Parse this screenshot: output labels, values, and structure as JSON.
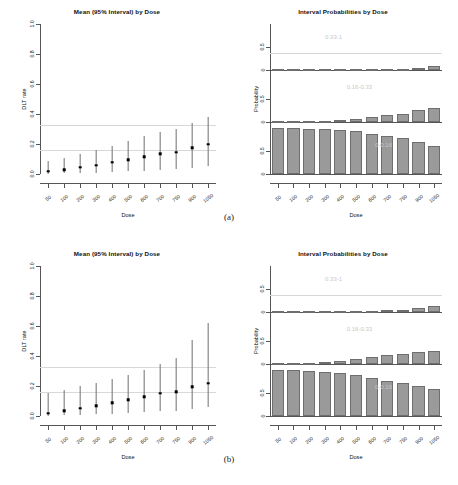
{
  "figure": {
    "subfigures": [
      {
        "caption": "(a)"
      },
      {
        "caption": "(b)"
      }
    ]
  },
  "panels": {
    "mean_title": "Mean (95% Interval) by Dose",
    "interval_title": "Interval Probabilities by Dose",
    "xlabel": "Dose",
    "ylabel_mean": "DLT rate",
    "ylabel_interval": "Probability",
    "y_ticks_mean": [
      "0.0",
      "0.2",
      "0.4",
      "0.6",
      "0.8",
      "1.0"
    ],
    "y_ticks_interval": [
      "0",
      "0.5",
      "0",
      "0.5",
      "0",
      "0.5"
    ],
    "x_ticks": [
      "50",
      "100",
      "200",
      "300",
      "400",
      "500",
      "600",
      "700",
      "750",
      "900",
      "1050"
    ],
    "group_labels": {
      "high": "0.33-1",
      "target": "0.16-0.33",
      "low": "0-0.16"
    },
    "colors": {
      "bar_fill": "#9a9a9a",
      "bar_border": "#6e6e6e",
      "point": "#000000",
      "errorbar": "#6f6f6f",
      "axis": "#555555",
      "group_label": "#c8c8c8",
      "reference_line": "#d8d8d8"
    }
  },
  "chart_data": [
    {
      "type": "scatter",
      "id": "a-mean",
      "title": "Mean (95% Interval) by Dose",
      "xlabel": "Dose",
      "ylabel": "DLT rate",
      "ylim": [
        0.0,
        1.0
      ],
      "grid": false,
      "reference_lines": [
        0.16,
        0.33
      ],
      "categories": [
        "50",
        "100",
        "200",
        "300",
        "400",
        "500",
        "600",
        "700",
        "750",
        "900",
        "1050"
      ],
      "mean": [
        0.026,
        0.038,
        0.052,
        0.068,
        0.087,
        0.104,
        0.124,
        0.145,
        0.154,
        0.183,
        0.207
      ],
      "lower": [
        0.002,
        0.004,
        0.006,
        0.009,
        0.013,
        0.017,
        0.022,
        0.028,
        0.031,
        0.042,
        0.053
      ],
      "upper": [
        0.086,
        0.11,
        0.134,
        0.16,
        0.19,
        0.219,
        0.251,
        0.283,
        0.297,
        0.342,
        0.383
      ]
    },
    {
      "type": "bar",
      "id": "a-interval",
      "title": "Interval Probabilities by Dose",
      "xlabel": "Dose",
      "ylabel": "Probability",
      "grid": false,
      "categories": [
        "50",
        "100",
        "200",
        "300",
        "400",
        "500",
        "600",
        "700",
        "750",
        "900",
        "1050"
      ],
      "series": [
        {
          "name": "0.33-1",
          "values": [
            0.0,
            0.0,
            0.001,
            0.002,
            0.004,
            0.008,
            0.015,
            0.025,
            0.031,
            0.053,
            0.078
          ]
        },
        {
          "name": "0.16-0.33",
          "values": [
            0.002,
            0.005,
            0.011,
            0.022,
            0.04,
            0.067,
            0.108,
            0.157,
            0.182,
            0.254,
            0.313
          ]
        },
        {
          "name": "0-0.16",
          "values": [
            0.998,
            0.995,
            0.988,
            0.976,
            0.956,
            0.925,
            0.877,
            0.818,
            0.787,
            0.693,
            0.609
          ]
        }
      ]
    },
    {
      "type": "scatter",
      "id": "b-mean",
      "title": "Mean (95% Interval) by Dose",
      "xlabel": "Dose",
      "ylabel": "DLT rate",
      "ylim": [
        0.0,
        1.0
      ],
      "grid": false,
      "reference_lines": [
        0.16,
        0.33
      ],
      "categories": [
        "50",
        "100",
        "200",
        "300",
        "400",
        "500",
        "600",
        "700",
        "750",
        "900",
        "1050"
      ],
      "mean": [
        0.028,
        0.042,
        0.06,
        0.078,
        0.098,
        0.117,
        0.137,
        0.16,
        0.17,
        0.202,
        0.228
      ],
      "lower": [
        0.003,
        0.005,
        0.008,
        0.012,
        0.016,
        0.021,
        0.026,
        0.033,
        0.036,
        0.047,
        0.058
      ],
      "upper": [
        0.152,
        0.175,
        0.199,
        0.222,
        0.25,
        0.275,
        0.305,
        0.345,
        0.39,
        0.505,
        0.622
      ]
    },
    {
      "type": "bar",
      "id": "b-interval",
      "title": "Interval Probabilities by Dose",
      "xlabel": "Dose",
      "ylabel": "Probability",
      "grid": false,
      "categories": [
        "50",
        "100",
        "200",
        "300",
        "400",
        "500",
        "600",
        "700",
        "750",
        "900",
        "1050"
      ],
      "series": [
        {
          "name": "0.33-1",
          "values": [
            0.0,
            0.0,
            0.001,
            0.003,
            0.006,
            0.012,
            0.024,
            0.041,
            0.05,
            0.085,
            0.124
          ]
        },
        {
          "name": "0.16-0.33",
          "values": [
            0.003,
            0.008,
            0.019,
            0.036,
            0.063,
            0.099,
            0.152,
            0.202,
            0.223,
            0.268,
            0.281
          ]
        },
        {
          "name": "0-0.16",
          "values": [
            0.997,
            0.992,
            0.98,
            0.961,
            0.931,
            0.889,
            0.824,
            0.757,
            0.727,
            0.647,
            0.595
          ]
        }
      ]
    }
  ]
}
